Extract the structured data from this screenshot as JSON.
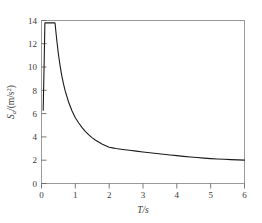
{
  "chart_data": {
    "type": "line",
    "title": "",
    "xlabel": "T/s",
    "ylabel": "S_a/(m/s2)",
    "ylabel_parts": {
      "symbol": "S",
      "subscript": "a",
      "unit": "/(m/s",
      "superscript": "2",
      "unit_close": ")"
    },
    "xlim": [
      0,
      6
    ],
    "ylim": [
      0,
      14
    ],
    "xticks": [
      0,
      1,
      2,
      3,
      4,
      5,
      6
    ],
    "xtick_labels": [
      "0",
      "1",
      "2",
      "3",
      "4",
      "5",
      "6"
    ],
    "yticks": [
      0,
      2,
      4,
      6,
      8,
      10,
      12,
      14
    ],
    "ytick_labels": [
      "0",
      "2",
      "4",
      "6",
      "8",
      "10",
      "12",
      "14"
    ],
    "grid": false,
    "legend": null,
    "line_color": "#1a1a1a",
    "line_width": 1.1,
    "frame_color": "#9a9a9a",
    "background": "#ffffff",
    "series": [
      {
        "name": "design response spectrum",
        "x": [
          0.05,
          0.08,
          0.1,
          0.12,
          0.2,
          0.3,
          0.38,
          0.4,
          0.42,
          0.45,
          0.5,
          0.55,
          0.6,
          0.65,
          0.7,
          0.8,
          0.9,
          1.0,
          1.1,
          1.2,
          1.3,
          1.4,
          1.5,
          1.6,
          1.7,
          1.8,
          1.9,
          2.0,
          2.1,
          2.2,
          2.4,
          2.6,
          2.8,
          3.0,
          3.2,
          3.4,
          3.6,
          3.8,
          4.0,
          4.2,
          4.4,
          4.6,
          4.8,
          5.0,
          5.2,
          5.4,
          5.6,
          5.8,
          6.0
        ],
        "y": [
          6.3,
          10.6,
          13.78,
          13.8,
          13.8,
          13.8,
          13.8,
          13.78,
          13.2,
          12.35,
          11.1,
          10.1,
          9.25,
          8.55,
          7.95,
          7.0,
          6.25,
          5.65,
          5.2,
          4.8,
          4.45,
          4.17,
          3.92,
          3.72,
          3.54,
          3.38,
          3.24,
          3.12,
          3.06,
          3.0,
          2.92,
          2.85,
          2.78,
          2.71,
          2.64,
          2.58,
          2.51,
          2.45,
          2.39,
          2.33,
          2.28,
          2.23,
          2.18,
          2.14,
          2.11,
          2.08,
          2.05,
          2.03,
          2.01
        ]
      }
    ],
    "annotations": {
      "peak_value": 13.8,
      "peak_range_start": 0.1,
      "peak_range_end": 0.4,
      "start_value": 6.3,
      "end_value": 2.0
    }
  }
}
